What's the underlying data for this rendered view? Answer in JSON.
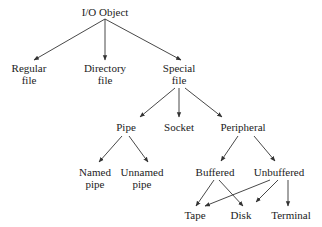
{
  "diagram": {
    "type": "tree",
    "colors": {
      "background": "#ffffff",
      "text": "#222222",
      "edge": "#333333"
    },
    "nodes": [
      {
        "id": "io",
        "lines": [
          "I/O Object"
        ],
        "x": 105,
        "y": 12
      },
      {
        "id": "regular",
        "lines": [
          "Regular",
          "file"
        ],
        "x": 29,
        "y": 74
      },
      {
        "id": "directory",
        "lines": [
          "Directory",
          "file"
        ],
        "x": 105,
        "y": 74
      },
      {
        "id": "special",
        "lines": [
          "Special",
          "file"
        ],
        "x": 179,
        "y": 74
      },
      {
        "id": "pipe",
        "lines": [
          "Pipe"
        ],
        "x": 126,
        "y": 127
      },
      {
        "id": "socket",
        "lines": [
          "Socket"
        ],
        "x": 179,
        "y": 127
      },
      {
        "id": "peripheral",
        "lines": [
          "Peripheral"
        ],
        "x": 243,
        "y": 127
      },
      {
        "id": "named",
        "lines": [
          "Named",
          "pipe"
        ],
        "x": 95,
        "y": 178
      },
      {
        "id": "unnamed",
        "lines": [
          "Unnamed",
          "pipe"
        ],
        "x": 142,
        "y": 178
      },
      {
        "id": "buffered",
        "lines": [
          "Buffered"
        ],
        "x": 215,
        "y": 172
      },
      {
        "id": "unbuffered",
        "lines": [
          "Unbuffered"
        ],
        "x": 279,
        "y": 172
      },
      {
        "id": "tape",
        "lines": [
          "Tape"
        ],
        "x": 195,
        "y": 215
      },
      {
        "id": "disk",
        "lines": [
          "Disk"
        ],
        "x": 241,
        "y": 215
      },
      {
        "id": "terminal",
        "lines": [
          "Terminal"
        ],
        "x": 291,
        "y": 215
      }
    ],
    "edges": [
      {
        "from": "io",
        "to": "regular",
        "x1": 105,
        "y1": 19,
        "x2": 34,
        "y2": 60
      },
      {
        "from": "io",
        "to": "directory",
        "x1": 105,
        "y1": 19,
        "x2": 105,
        "y2": 60
      },
      {
        "from": "io",
        "to": "special",
        "x1": 105,
        "y1": 19,
        "x2": 181,
        "y2": 60
      },
      {
        "from": "special",
        "to": "pipe",
        "x1": 175,
        "y1": 88,
        "x2": 140,
        "y2": 117
      },
      {
        "from": "special",
        "to": "socket",
        "x1": 179,
        "y1": 88,
        "x2": 179,
        "y2": 117
      },
      {
        "from": "special",
        "to": "peripheral",
        "x1": 185,
        "y1": 88,
        "x2": 222,
        "y2": 117
      },
      {
        "from": "pipe",
        "to": "named",
        "x1": 122,
        "y1": 136,
        "x2": 99,
        "y2": 162
      },
      {
        "from": "pipe",
        "to": "unnamed",
        "x1": 129,
        "y1": 136,
        "x2": 148,
        "y2": 162
      },
      {
        "from": "peripheral",
        "to": "buffered",
        "x1": 238,
        "y1": 136,
        "x2": 221,
        "y2": 161
      },
      {
        "from": "peripheral",
        "to": "unbuffered",
        "x1": 254,
        "y1": 136,
        "x2": 275,
        "y2": 161
      },
      {
        "from": "buffered",
        "to": "tape",
        "x1": 214,
        "y1": 180,
        "x2": 196,
        "y2": 206
      },
      {
        "from": "buffered",
        "to": "disk",
        "x1": 219,
        "y1": 180,
        "x2": 243,
        "y2": 206
      },
      {
        "from": "unbuffered",
        "to": "tape",
        "x1": 270,
        "y1": 180,
        "x2": 205,
        "y2": 206
      },
      {
        "from": "unbuffered",
        "to": "disk",
        "x1": 278,
        "y1": 180,
        "x2": 256,
        "y2": 202
      },
      {
        "from": "unbuffered",
        "to": "terminal",
        "x1": 288,
        "y1": 180,
        "x2": 288,
        "y2": 206
      }
    ]
  }
}
